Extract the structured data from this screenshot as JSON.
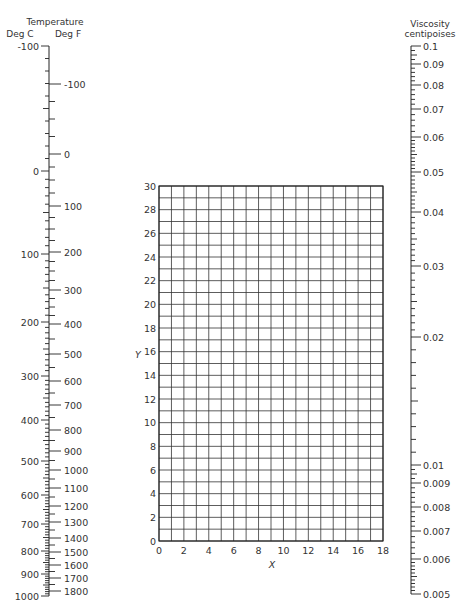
{
  "chart_data": {
    "type": "nomograph",
    "temperature_scale": {
      "title": "Temperature",
      "left_unit": "Deg C",
      "right_unit": "Deg F",
      "deg_c_labels": [
        "-100",
        "0",
        "100",
        "200",
        "300",
        "400",
        "500",
        "600",
        "700",
        "800",
        "900",
        "1000"
      ],
      "deg_c_values": [
        -100,
        0,
        100,
        200,
        300,
        400,
        500,
        600,
        700,
        800,
        900,
        1000
      ],
      "deg_c_y": [
        46,
        171,
        254,
        322,
        376,
        420,
        461,
        495,
        524,
        551,
        574,
        596
      ],
      "deg_f_labels": [
        "-100",
        "0",
        "100",
        "200",
        "300",
        "400",
        "500",
        "600",
        "700",
        "800",
        "900",
        "1000",
        "1100",
        "1200",
        "1300",
        "1400",
        "1500",
        "1600",
        "1700",
        "1800"
      ],
      "deg_f_values": [
        -100,
        0,
        100,
        200,
        300,
        400,
        500,
        600,
        700,
        800,
        900,
        1000,
        1100,
        1200,
        1300,
        1400,
        1500,
        1600,
        1700,
        1800
      ],
      "deg_f_y": [
        84,
        154,
        206,
        252,
        290,
        324,
        354,
        381,
        405,
        430,
        451,
        470,
        488,
        506,
        522,
        538,
        552,
        565,
        578,
        591
      ]
    },
    "grid": {
      "xlabel": "X",
      "ylabel": "Y",
      "xlim": [
        0,
        18
      ],
      "ylim": [
        0,
        30
      ],
      "x_ticks": [
        "0",
        "2",
        "4",
        "6",
        "8",
        "10",
        "12",
        "14",
        "16",
        "18"
      ],
      "y_ticks": [
        "0",
        "2",
        "4",
        "6",
        "8",
        "10",
        "12",
        "14",
        "16",
        "18",
        "20",
        "22",
        "24",
        "26",
        "28",
        "30"
      ],
      "grid_on": true,
      "minor_step": 1
    },
    "viscosity_scale": {
      "title_line1": "Viscosity",
      "title_line2": "centipoises",
      "labels": [
        "0.1",
        "0.09",
        "0.08",
        "0.07",
        "0.06",
        "0.05",
        "0.04",
        "0.03",
        "0.02",
        "0.01",
        "0.009",
        "0.008",
        "0.007",
        "0.006",
        "0.005"
      ],
      "values": [
        0.1,
        0.09,
        0.08,
        0.07,
        0.06,
        0.05,
        0.04,
        0.03,
        0.02,
        0.01,
        0.009,
        0.008,
        0.007,
        0.006,
        0.005
      ],
      "y": [
        46,
        64,
        85,
        109,
        137,
        172,
        212,
        266,
        337,
        465,
        483,
        507,
        531,
        559,
        594
      ]
    }
  }
}
